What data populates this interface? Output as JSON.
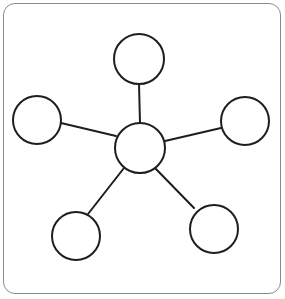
{
  "diagram": {
    "type": "star-network",
    "frame": {
      "border_color": "#8a8a8a",
      "background": "#ffffff"
    },
    "style": {
      "stroke_color": "#1e1e1e",
      "stroke_width": 2,
      "node_fill": "#ffffff"
    },
    "hub": {
      "id": "hub",
      "cx": 140,
      "cy": 148,
      "r": 25
    },
    "nodes": [
      {
        "id": "node-top",
        "cx": 139,
        "cy": 59,
        "r": 25,
        "edge": {
          "x1": 140,
          "y1": 123,
          "x2": 139,
          "y2": 84
        }
      },
      {
        "id": "node-left",
        "cx": 37,
        "cy": 120,
        "r": 24,
        "edge": {
          "x1": 116,
          "y1": 136,
          "x2": 61,
          "y2": 123
        }
      },
      {
        "id": "node-right",
        "cx": 245,
        "cy": 121,
        "r": 24,
        "edge": {
          "x1": 165,
          "y1": 141,
          "x2": 221,
          "y2": 128
        }
      },
      {
        "id": "node-bottom-left",
        "cx": 76,
        "cy": 236,
        "r": 24,
        "edge": {
          "x1": 124,
          "y1": 168,
          "x2": 88,
          "y2": 214
        }
      },
      {
        "id": "node-bottom-right",
        "cx": 214,
        "cy": 229,
        "r": 24,
        "edge": {
          "x1": 154,
          "y1": 167,
          "x2": 194,
          "y2": 208
        }
      }
    ]
  }
}
